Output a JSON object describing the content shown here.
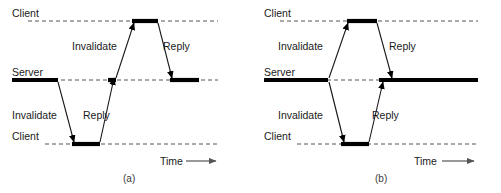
{
  "figure": {
    "width": 501,
    "height": 193,
    "background_color": "#ffffff",
    "line_color": "#000000",
    "dashed_color": "#555555",
    "text_color": "#1a1a1a"
  },
  "panels": [
    {
      "id": "a",
      "caption": "(a)",
      "caption_x": 123,
      "caption_y": 182,
      "lanes": [
        {
          "name": "client-top",
          "label": "Client",
          "label_x": 12,
          "label_y": 17,
          "line_y": 21,
          "line_x1": 28,
          "line_x2": 218
        },
        {
          "name": "server-middle",
          "label": "Server",
          "label_x": 12,
          "label_y": 76,
          "line_y": 80,
          "line_x1": 12,
          "line_x2": 218
        },
        {
          "name": "client-bottom",
          "label": "Client",
          "label_x": 12,
          "label_y": 140,
          "line_y": 144,
          "line_x1": 45,
          "line_x2": 218
        }
      ],
      "active_bars": [
        {
          "name": "server-bar-left",
          "lane": "server-middle",
          "y": 80,
          "x1": 12,
          "x2": 58
        },
        {
          "name": "client-bottom-bar",
          "lane": "client-bottom",
          "y": 144,
          "x1": 72,
          "x2": 100
        },
        {
          "name": "server-bar-stub",
          "lane": "server-middle",
          "y": 80,
          "x1": 108,
          "x2": 116
        },
        {
          "name": "client-top-bar",
          "lane": "client-top",
          "y": 21,
          "x1": 132,
          "x2": 158
        },
        {
          "name": "server-bar-right",
          "lane": "server-middle",
          "y": 80,
          "x1": 170,
          "x2": 199
        }
      ],
      "messages": [
        {
          "name": "invalidate-down",
          "label": "Invalidate",
          "label_x": 12,
          "label_y": 119,
          "x1": 58,
          "y1": 82,
          "x2": 74,
          "y2": 142
        },
        {
          "name": "reply-up",
          "label": "Reply",
          "label_x": 83,
          "label_y": 119,
          "x1": 100,
          "y1": 142,
          "x2": 114,
          "y2": 78
        },
        {
          "name": "invalidate-up",
          "label": "Invalidate",
          "label_x": 72,
          "label_y": 50,
          "x1": 116,
          "y1": 78,
          "x2": 134,
          "y2": 23
        },
        {
          "name": "reply-down",
          "label": "Reply",
          "label_x": 163,
          "label_y": 50,
          "x1": 158,
          "y1": 23,
          "x2": 172,
          "y2": 78
        }
      ],
      "time_axis": {
        "label": "Time",
        "label_x": 160,
        "label_y": 165,
        "x1": 186,
        "x2": 216,
        "y": 161
      }
    },
    {
      "id": "b",
      "caption": "(b)",
      "caption_x": 375,
      "caption_y": 182,
      "lanes": [
        {
          "name": "client-top",
          "label": "Client",
          "label_x": 264,
          "label_y": 17,
          "line_y": 21,
          "line_x1": 280,
          "line_x2": 478
        },
        {
          "name": "server-middle",
          "label": "Server",
          "label_x": 264,
          "label_y": 76,
          "line_y": 80,
          "line_x1": 264,
          "line_x2": 478
        },
        {
          "name": "client-bottom",
          "label": "Client",
          "label_x": 264,
          "label_y": 140,
          "line_y": 144,
          "line_x1": 297,
          "line_x2": 478
        }
      ],
      "active_bars": [
        {
          "name": "server-bar-left",
          "lane": "server-middle",
          "y": 80,
          "x1": 264,
          "x2": 328
        },
        {
          "name": "client-top-bar",
          "lane": "client-top",
          "y": 21,
          "x1": 347,
          "x2": 377
        },
        {
          "name": "client-bottom-bar",
          "lane": "client-bottom",
          "y": 144,
          "x1": 341,
          "x2": 369
        },
        {
          "name": "server-bar-right",
          "lane": "server-middle",
          "y": 80,
          "x1": 379,
          "x2": 478
        }
      ],
      "messages": [
        {
          "name": "invalidate-up",
          "label": "Invalidate",
          "label_x": 278,
          "label_y": 50,
          "x1": 329,
          "y1": 78,
          "x2": 348,
          "y2": 23
        },
        {
          "name": "reply-down",
          "label": "Reply",
          "label_x": 389,
          "label_y": 50,
          "x1": 377,
          "y1": 23,
          "x2": 392,
          "y2": 78
        },
        {
          "name": "invalidate-down",
          "label": "Invalidate",
          "label_x": 278,
          "label_y": 119,
          "x1": 329,
          "y1": 82,
          "x2": 344,
          "y2": 142
        },
        {
          "name": "reply-up",
          "label": "Reply",
          "label_x": 372,
          "label_y": 119,
          "x1": 369,
          "y1": 142,
          "x2": 383,
          "y2": 82
        }
      ],
      "time_axis": {
        "label": "Time",
        "label_x": 414,
        "label_y": 165,
        "x1": 442,
        "x2": 474,
        "y": 161
      }
    }
  ]
}
